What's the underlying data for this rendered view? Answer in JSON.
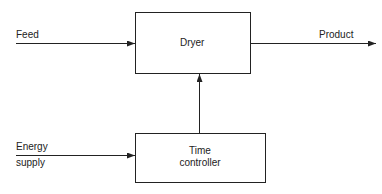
{
  "diagram": {
    "blocks": [
      {
        "id": "dryer",
        "label": "Dryer"
      },
      {
        "id": "time_controller",
        "label_line1": "Time",
        "label_line2": "controller"
      }
    ],
    "inputs": {
      "feed": "Feed",
      "energy_line1": "Energy",
      "energy_line2": "supply"
    },
    "outputs": {
      "product": "Product"
    },
    "colors": {
      "line": "#222222",
      "background": "#ffffff"
    }
  }
}
